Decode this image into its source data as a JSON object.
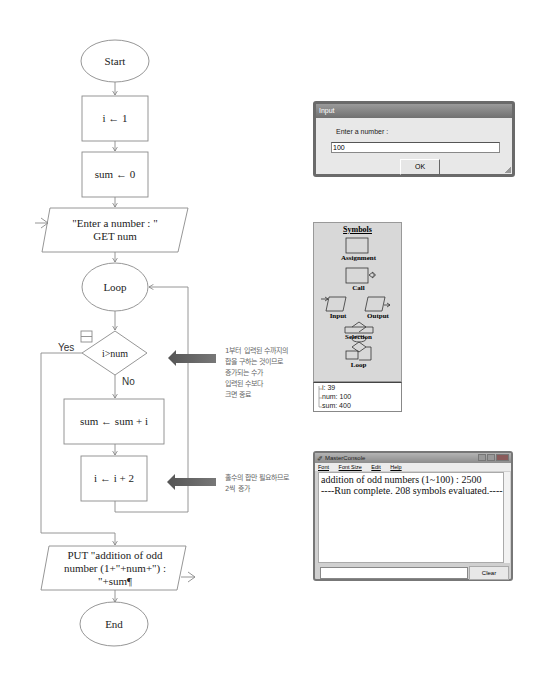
{
  "flowchart": {
    "start": "Start",
    "assign1": "i ← 1",
    "assign2": "sum ← 0",
    "input_line1": "\"Enter a number : \"",
    "input_line2": "GET num",
    "loop": "Loop",
    "condition": "i>num",
    "yes_label": "Yes",
    "no_label": "No",
    "assign3": "sum ← sum + i",
    "assign4": "i ← i + 2",
    "output_line1": "PUT \"addition of odd",
    "output_line2": "number (1+\"+num+\") :",
    "output_line3": "\"+sum¶",
    "end": "End"
  },
  "annotations": [
    {
      "lines": [
        "1부터 입력된 수까지의",
        "합을 구하는 것이므로",
        "증가되는 수가",
        "입력된 수보다",
        "크면 종료"
      ]
    },
    {
      "lines": [
        "홀수의 합만 필요하므로",
        "2씩 증가"
      ]
    }
  ],
  "input_dialog": {
    "title": "Input",
    "prompt": "Enter a number :",
    "value": "100",
    "ok_label": "OK"
  },
  "symbols_panel": {
    "title": "Symbols",
    "items": [
      "Assignment",
      "Call",
      "Input",
      "Output",
      "Selection",
      "Loop"
    ]
  },
  "variables": [
    {
      "text": "i: 39"
    },
    {
      "text": "num: 100"
    },
    {
      "text": "sum: 400"
    }
  ],
  "console": {
    "title": "MasterConsole",
    "menu": [
      "Font",
      "Font Size",
      "Edit",
      "Help"
    ],
    "output": [
      "addition of odd numbers (1~100) : 2500",
      "----Run complete.  208 symbols evaluated.----"
    ],
    "input_value": "",
    "clear_label": "Clear"
  },
  "colors": {
    "line": "#8a8a8a",
    "arrow": "#666666",
    "panel": "#d8d8d8"
  }
}
